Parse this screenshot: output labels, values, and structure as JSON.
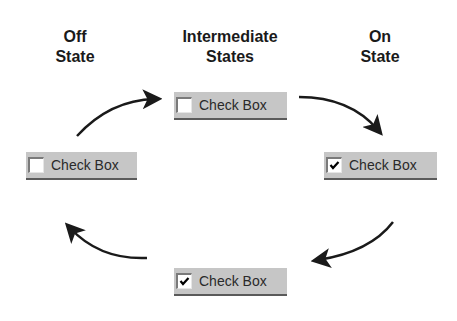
{
  "headings": {
    "off": {
      "line1": "Off",
      "line2": "State"
    },
    "intermediate": {
      "line1": "Intermediate",
      "line2": "States"
    },
    "on": {
      "line1": "On",
      "line2": "State"
    }
  },
  "checkboxes": [
    {
      "id": "off",
      "label": "Check Box",
      "checked": false
    },
    {
      "id": "intermediate-top",
      "label": "Check Box",
      "checked": false
    },
    {
      "id": "on",
      "label": "Check Box",
      "checked": true
    },
    {
      "id": "intermediate-bottom",
      "label": "Check Box",
      "checked": true
    }
  ],
  "colors": {
    "widget_bg": "#c6c6c6",
    "arrow": "#1a1a1a"
  }
}
